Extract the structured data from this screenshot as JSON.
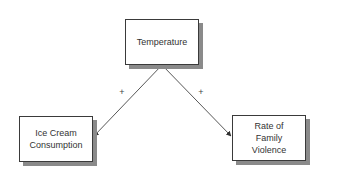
{
  "diagram": {
    "type": "causal-diagram",
    "nodes": [
      {
        "id": "temperature",
        "lines": [
          "Temperature"
        ]
      },
      {
        "id": "icecream",
        "lines": [
          "Ice Cream",
          "Consumption"
        ]
      },
      {
        "id": "violence",
        "lines": [
          "Rate of",
          "Family",
          "Violence"
        ]
      }
    ],
    "edges": [
      {
        "from": "temperature",
        "to": "icecream",
        "sign": "+"
      },
      {
        "from": "temperature",
        "to": "violence",
        "sign": "+"
      }
    ],
    "colors": {
      "border": "#3a3a3a",
      "shadow": "#8a8a8a",
      "line": "#444444",
      "text": "#333333"
    }
  }
}
